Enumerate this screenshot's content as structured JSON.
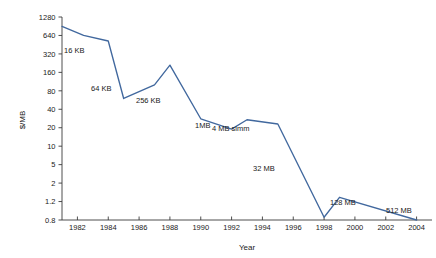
{
  "chart_data": {
    "type": "line",
    "title": "",
    "xlabel": "Year",
    "ylabel": "$/MB",
    "xlim": [
      1981,
      2005
    ],
    "ylim": [
      0.8,
      1280
    ],
    "yscale": "log",
    "grid": false,
    "legend": "none",
    "line_color": "#41689e",
    "axis_color": "#3b3b3b",
    "x_ticks": [
      "1982",
      "1984",
      "1986",
      "1988",
      "1990",
      "1992",
      "1994",
      "1996",
      "1998",
      "2000",
      "2002",
      "2004"
    ],
    "y_ticks": [
      "1280",
      "640",
      "320",
      "160",
      "80",
      "40",
      "20",
      "10",
      "5",
      "2",
      "1.2",
      "0.8"
    ],
    "x": [
      1981.0,
      1982.4,
      1984.0,
      1985.0,
      1987.0,
      1988.0,
      1990.0,
      1992.0,
      1993.0,
      1995.0,
      1998.0,
      1999.0,
      2004.0
    ],
    "y": [
      900,
      640,
      520,
      60,
      100,
      210,
      28,
      19,
      27,
      23,
      0.85,
      1.35,
      0.8
    ],
    "series": [
      {
        "name": "DRAM price",
        "points": [
          {
            "year": 1981.0,
            "price": 900
          },
          {
            "year": 1982.4,
            "price": 640
          },
          {
            "year": 1984.0,
            "price": 520
          },
          {
            "year": 1985.0,
            "price": 60
          },
          {
            "year": 1987.0,
            "price": 100
          },
          {
            "year": 1988.0,
            "price": 210
          },
          {
            "year": 1990.0,
            "price": 28
          },
          {
            "year": 1992.0,
            "price": 19
          },
          {
            "year": 1993.0,
            "price": 27
          },
          {
            "year": 1995.0,
            "price": 23
          },
          {
            "year": 1998.0,
            "price": 0.85
          },
          {
            "year": 1999.0,
            "price": 1.35
          },
          {
            "year": 2004.0,
            "price": 0.8
          }
        ]
      }
    ],
    "annotations": [
      {
        "text": "16 KB",
        "x": 64,
        "y": 53
      },
      {
        "text": "64 KB",
        "x": 91,
        "y": 91
      },
      {
        "text": "256 KB",
        "x": 136,
        "y": 103
      },
      {
        "text": "1MB",
        "x": 195,
        "y": 128
      },
      {
        "text": "4 MB simm",
        "x": 212,
        "y": 131
      },
      {
        "text": "32 MB",
        "x": 253,
        "y": 171
      },
      {
        "text": "128 MB",
        "x": 330,
        "y": 205
      },
      {
        "text": "512 MB",
        "x": 386,
        "y": 213
      }
    ]
  }
}
